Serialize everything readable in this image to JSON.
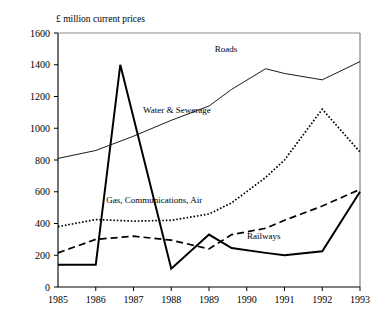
{
  "chart_data": {
    "type": "line",
    "title": "£ million current prices",
    "xlabel": "",
    "ylabel": "",
    "x": [
      1985,
      1986,
      1987,
      1988,
      1989,
      1990,
      1991,
      1992,
      1993
    ],
    "categories": [
      "1985",
      "1986",
      "1987",
      "1988",
      "1989",
      "1990",
      "1991",
      "1992",
      "1993"
    ],
    "xlim": [
      1985,
      1993
    ],
    "ylim": [
      0,
      1600
    ],
    "yticks": [
      0,
      200,
      400,
      600,
      800,
      1000,
      1200,
      1400,
      1600
    ],
    "ytick_labels": [
      "0",
      "200",
      "400",
      "600",
      "800",
      "1000",
      "1200",
      "1400",
      "1600"
    ],
    "grid": false,
    "legend": "inline-labels",
    "series": [
      {
        "name": "Roads",
        "style": "solid-thin",
        "label": "Roads",
        "label_x": 1989.45,
        "label_y": 1480,
        "values": [
          810,
          860,
          950,
          1050,
          1140,
          1245,
          1375,
          1345,
          1305,
          1420
        ],
        "x_values": [
          1985,
          1986,
          1987,
          1988,
          1989,
          1989.6,
          1990.5,
          1991,
          1992,
          1993
        ]
      },
      {
        "name": "Water & Sewerage",
        "style": "dotted",
        "label": "Water & Sewerage",
        "label_x": 1988.15,
        "label_y": 1095,
        "values": [
          380,
          425,
          415,
          420,
          460,
          530,
          690,
          800,
          1120,
          850
        ],
        "x_values": [
          1985,
          1986,
          1987,
          1988,
          1989,
          1989.6,
          1990.5,
          1991,
          1992,
          1993
        ]
      },
      {
        "name": "Gas, Communications, Air",
        "style": "dashed",
        "label": "Gas, Communications, Air",
        "label_x": 1987.55,
        "label_y": 530,
        "values": [
          215,
          300,
          320,
          295,
          240,
          330,
          370,
          420,
          510,
          615
        ],
        "x_values": [
          1985,
          1986,
          1987,
          1988,
          1989,
          1989.6,
          1990.5,
          1991,
          1992,
          1993
        ]
      },
      {
        "name": "Railways",
        "style": "solid-thick",
        "label": "Railways",
        "label_x": 1990.45,
        "label_y": 300,
        "values": [
          140,
          140,
          1400,
          115,
          330,
          245,
          215,
          200,
          225,
          600
        ],
        "x_values": [
          1985,
          1986,
          1986.65,
          1988,
          1989,
          1989.6,
          1990.5,
          1991,
          1992,
          1993
        ]
      }
    ]
  },
  "axis": {
    "unit_note": "£ million current prices"
  }
}
